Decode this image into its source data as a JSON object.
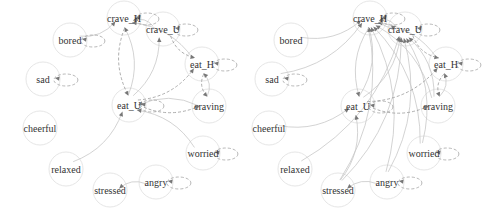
{
  "graphs": [
    {
      "id": "left",
      "nodes": [
        {
          "id": "crave_H",
          "x": 124,
          "y": 18
        },
        {
          "id": "crave_U",
          "x": 163,
          "y": 29
        },
        {
          "id": "bored",
          "x": 70,
          "y": 40
        },
        {
          "id": "eat_H",
          "x": 202,
          "y": 64
        },
        {
          "id": "sad",
          "x": 43,
          "y": 79
        },
        {
          "id": "eat_U",
          "x": 129,
          "y": 105
        },
        {
          "id": "craving",
          "x": 209,
          "y": 106
        },
        {
          "id": "cheerful",
          "x": 40,
          "y": 128
        },
        {
          "id": "worried",
          "x": 203,
          "y": 153
        },
        {
          "id": "relaxed",
          "x": 66,
          "y": 169
        },
        {
          "id": "angry",
          "x": 156,
          "y": 182
        },
        {
          "id": "stressed",
          "x": 110,
          "y": 190
        }
      ],
      "edges": [
        {
          "from": "crave_U",
          "to": "crave_H",
          "dashed": false
        },
        {
          "from": "bored",
          "to": "crave_H",
          "dashed": false
        },
        {
          "from": "eat_H",
          "to": "crave_H",
          "dashed": false
        },
        {
          "from": "crave_U",
          "to": "eat_H",
          "dashed": true
        },
        {
          "from": "eat_U",
          "to": "crave_H",
          "dashed": false
        },
        {
          "from": "crave_H",
          "to": "eat_U",
          "dashed": true
        },
        {
          "from": "eat_U",
          "to": "crave_U",
          "dashed": false
        },
        {
          "from": "eat_U",
          "to": "eat_H",
          "dashed": true
        },
        {
          "from": "eat_H",
          "to": "craving",
          "dashed": true
        },
        {
          "from": "craving",
          "to": "eat_H",
          "dashed": false
        },
        {
          "from": "eat_U",
          "to": "craving",
          "dashed": true
        },
        {
          "from": "craving",
          "to": "eat_U",
          "dashed": false
        },
        {
          "from": "worried",
          "to": "eat_U",
          "dashed": false
        },
        {
          "from": "relaxed",
          "to": "eat_U",
          "dashed": false
        },
        {
          "from": "angry",
          "to": "stressed",
          "dashed": false
        }
      ],
      "self_loops": [
        "crave_H",
        "crave_U",
        "bored",
        "eat_H",
        "sad",
        "eat_U",
        "worried",
        "angry"
      ]
    },
    {
      "id": "right",
      "nodes": [
        {
          "id": "crave_H",
          "x": 370,
          "y": 18
        },
        {
          "id": "crave_U",
          "x": 405,
          "y": 29
        },
        {
          "id": "bored",
          "x": 291,
          "y": 40
        },
        {
          "id": "eat_H",
          "x": 446,
          "y": 64
        },
        {
          "id": "sad",
          "x": 272,
          "y": 79
        },
        {
          "id": "eat_U",
          "x": 358,
          "y": 106
        },
        {
          "id": "craving",
          "x": 438,
          "y": 106
        },
        {
          "id": "cheerful",
          "x": 269,
          "y": 128
        },
        {
          "id": "worried",
          "x": 424,
          "y": 153
        },
        {
          "id": "relaxed",
          "x": 295,
          "y": 169
        },
        {
          "id": "angry",
          "x": 387,
          "y": 182
        },
        {
          "id": "stressed",
          "x": 338,
          "y": 190
        }
      ],
      "edges": [
        {
          "from": "crave_U",
          "to": "crave_H",
          "dashed": false
        },
        {
          "from": "bored",
          "to": "crave_H",
          "dashed": false
        },
        {
          "from": "sad",
          "to": "crave_H",
          "dashed": false
        },
        {
          "from": "eat_H",
          "to": "crave_H",
          "dashed": false
        },
        {
          "from": "eat_U",
          "to": "crave_H",
          "dashed": false
        },
        {
          "from": "craving",
          "to": "crave_H",
          "dashed": false
        },
        {
          "from": "worried",
          "to": "crave_H",
          "dashed": false
        },
        {
          "from": "angry",
          "to": "crave_H",
          "dashed": false
        },
        {
          "from": "stressed",
          "to": "crave_H",
          "dashed": false
        },
        {
          "from": "crave_H",
          "to": "crave_U",
          "dashed": false
        },
        {
          "from": "eat_U",
          "to": "crave_U",
          "dashed": false
        },
        {
          "from": "craving",
          "to": "crave_U",
          "dashed": false
        },
        {
          "from": "worried",
          "to": "crave_U",
          "dashed": false
        },
        {
          "from": "angry",
          "to": "crave_U",
          "dashed": false
        },
        {
          "from": "stressed",
          "to": "crave_U",
          "dashed": false
        },
        {
          "from": "relaxed",
          "to": "crave_U",
          "dashed": false
        },
        {
          "from": "crave_U",
          "to": "eat_H",
          "dashed": true
        },
        {
          "from": "crave_H",
          "to": "eat_U",
          "dashed": false
        },
        {
          "from": "eat_U",
          "to": "eat_H",
          "dashed": true
        },
        {
          "from": "eat_H",
          "to": "craving",
          "dashed": true
        },
        {
          "from": "craving",
          "to": "eat_H",
          "dashed": false
        },
        {
          "from": "eat_U",
          "to": "craving",
          "dashed": true
        },
        {
          "from": "cheerful",
          "to": "eat_U",
          "dashed": false
        },
        {
          "from": "stressed",
          "to": "eat_U",
          "dashed": false
        },
        {
          "from": "angry",
          "to": "stressed",
          "dashed": false
        }
      ],
      "self_loops": [
        "crave_H",
        "crave_U",
        "eat_H",
        "sad",
        "eat_U",
        "worried",
        "angry"
      ]
    }
  ],
  "colors": {
    "node_stroke": "#e6e6e6",
    "edge": "#c8c8c8",
    "arrow": "#777777",
    "label": "#333333"
  }
}
